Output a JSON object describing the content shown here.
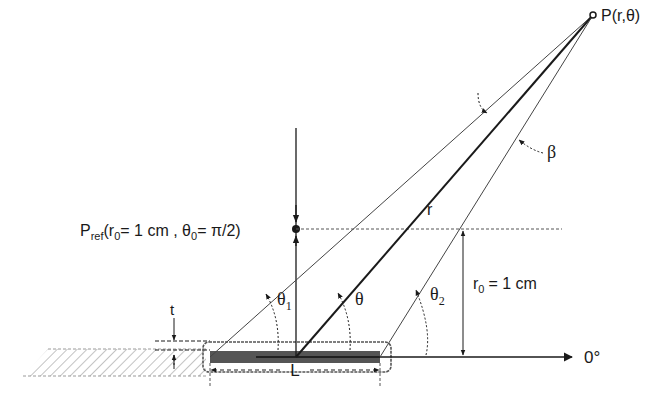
{
  "diagram": {
    "labels": {
      "point_p": "P(r,θ)",
      "pref_main": "P",
      "pref_sub": "ref",
      "pref_rest_1": "(r",
      "pref_r0_sub": "0",
      "pref_rest_2": "= 1 cm , θ",
      "pref_theta0_sub": "0",
      "pref_rest_3": "= π/2)",
      "r": "r",
      "beta": "β",
      "theta": "θ",
      "theta1_main": "θ",
      "theta1_sub": "1",
      "theta2_main": "θ",
      "theta2_sub": "2",
      "r0_main": "r",
      "r0_sub": "0",
      "r0_rest": "= 1 cm",
      "zero_deg": "0°",
      "t": "t",
      "L": "L"
    },
    "colors": {
      "line": "#1a1a1a",
      "thin_line": "#444444",
      "source_fill": "#555555",
      "hatch": "#9a9a9a",
      "capsule": "#555555"
    }
  }
}
